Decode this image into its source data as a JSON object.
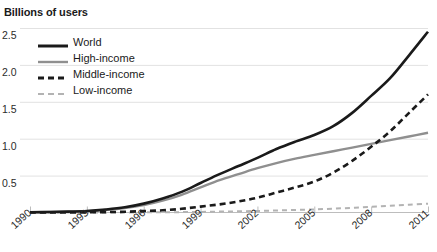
{
  "chart_data": {
    "type": "line",
    "title": "Billions of users",
    "xlabel": "",
    "ylabel": "Billions of users",
    "grid": true,
    "legend_position": "upper-left-inside",
    "xlim": [
      1990,
      2011
    ],
    "ylim": [
      0,
      2.6
    ],
    "yticks": [
      "0.5",
      "1.0",
      "1.5",
      "2.0",
      "2.5"
    ],
    "ytick_values": [
      0.5,
      1.0,
      1.5,
      2.0,
      2.5
    ],
    "xticks": [
      "1990",
      "1993",
      "1996",
      "1999",
      "2002",
      "2005",
      "2008",
      "2011"
    ],
    "xtick_values": [
      1990,
      1993,
      1996,
      1999,
      2002,
      2005,
      2008,
      2011
    ],
    "x": [
      1990,
      1991,
      1992,
      1993,
      1994,
      1995,
      1996,
      1997,
      1998,
      1999,
      2000,
      2001,
      2002,
      2003,
      2004,
      2005,
      2006,
      2007,
      2008,
      2009,
      2010,
      2011
    ],
    "series": [
      {
        "name": "World",
        "color": "#1a1a1a",
        "style": "solid",
        "width": 2.6,
        "values": [
          0.003,
          0.006,
          0.012,
          0.02,
          0.04,
          0.07,
          0.12,
          0.19,
          0.28,
          0.4,
          0.52,
          0.63,
          0.74,
          0.86,
          0.96,
          1.05,
          1.17,
          1.35,
          1.58,
          1.82,
          2.13,
          2.45
        ]
      },
      {
        "name": "High-income",
        "color": "#8f8f8f",
        "style": "solid",
        "width": 2.4,
        "values": [
          0.003,
          0.006,
          0.011,
          0.019,
          0.035,
          0.06,
          0.1,
          0.16,
          0.24,
          0.34,
          0.44,
          0.52,
          0.6,
          0.67,
          0.73,
          0.78,
          0.83,
          0.88,
          0.93,
          0.98,
          1.03,
          1.08
        ]
      },
      {
        "name": "Middle-income",
        "color": "#1a1a1a",
        "style": "dashed",
        "width": 2.6,
        "values": [
          0.0,
          0.0,
          0.001,
          0.002,
          0.005,
          0.01,
          0.02,
          0.03,
          0.05,
          0.08,
          0.11,
          0.15,
          0.2,
          0.27,
          0.34,
          0.42,
          0.54,
          0.7,
          0.89,
          1.1,
          1.35,
          1.6
        ]
      },
      {
        "name": "Low-income",
        "color": "#b3b3b3",
        "style": "dashed",
        "width": 2.0,
        "values": [
          0.0,
          0.0,
          0.0,
          0.0,
          0.001,
          0.001,
          0.002,
          0.003,
          0.005,
          0.008,
          0.012,
          0.016,
          0.021,
          0.027,
          0.034,
          0.042,
          0.052,
          0.063,
          0.076,
          0.091,
          0.105,
          0.12
        ]
      }
    ],
    "legend": [
      {
        "label": "World",
        "color": "#1a1a1a",
        "style": "solid",
        "width": 3
      },
      {
        "label": "High-income",
        "color": "#8f8f8f",
        "style": "solid",
        "width": 2.4
      },
      {
        "label": "Middle-income",
        "color": "#1a1a1a",
        "style": "dashed",
        "width": 3
      },
      {
        "label": "Low-income",
        "color": "#b3b3b3",
        "style": "dashed",
        "width": 2
      }
    ]
  },
  "colors": {
    "world": "#1a1a1a",
    "high_income": "#8f8f8f",
    "middle_income": "#1a1a1a",
    "low_income": "#b3b3b3",
    "grid": "#e2e2e2",
    "axis": "#bdbdbd",
    "text": "#1a1a1a"
  }
}
